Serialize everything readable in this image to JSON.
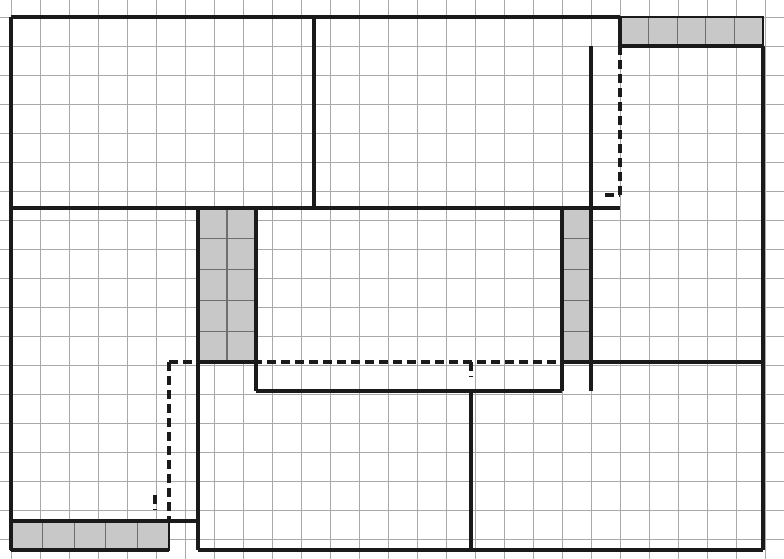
{
  "diagram": {
    "type": "architectural-grid-plan",
    "canvas": {
      "width": 784,
      "height": 559
    },
    "colors": {
      "background": "#ffffff",
      "grid_line": "#a9a9a9",
      "heavy_line": "#1a1a1a",
      "dashed_line": "#1a1a1a",
      "shaded_fill": "#c8c8c8",
      "shaded_stroke": "#6e6e6e"
    },
    "grid": {
      "origin_x": 11,
      "origin_y": 17,
      "cell_width": 29,
      "cell_height": 29,
      "columns": 26,
      "rows": 18,
      "line_width": 1,
      "visible": true,
      "extent_note": "Light gray square grid covering the full plan area; heavy lines snap to grid intersections."
    },
    "outline": {
      "label": "Overall plan boundary",
      "left": 11,
      "top": 17,
      "right": 763,
      "bottom": 550,
      "stroke_width": 4
    },
    "heavy_walls": [
      {
        "name": "outer-top-left-segment",
        "x1": 11,
        "y1": 17,
        "x2": 620,
        "y2": 17
      },
      {
        "name": "outer-top-right-segment",
        "x1": 620,
        "y1": 46,
        "x2": 763,
        "y2": 46
      },
      {
        "name": "shaded-top-strip-left-edge",
        "x1": 620,
        "y1": 17,
        "x2": 620,
        "y2": 46
      },
      {
        "name": "outer-left-edge",
        "x1": 11,
        "y1": 17,
        "x2": 11,
        "y2": 521
      },
      {
        "name": "outer-left-lower-edge",
        "x1": 11,
        "y1": 521,
        "x2": 11,
        "y2": 550
      },
      {
        "name": "outer-right-edge",
        "x1": 763,
        "y1": 46,
        "x2": 763,
        "y2": 550
      },
      {
        "name": "outer-bottom-edge",
        "x1": 198,
        "y1": 550,
        "x2": 763,
        "y2": 550
      },
      {
        "name": "bottom-left-strip-bottom",
        "x1": 11,
        "y1": 550,
        "x2": 169,
        "y2": 550
      },
      {
        "name": "bottom-left-strip-top",
        "x1": 11,
        "y1": 521,
        "x2": 198,
        "y2": 521
      },
      {
        "name": "upper-mid-vertical-divider",
        "x1": 314,
        "y1": 17,
        "x2": 314,
        "y2": 208
      },
      {
        "name": "mid-horizontal-wall-left",
        "x1": 11,
        "y1": 208,
        "x2": 591,
        "y2": 208
      },
      {
        "name": "mid-horizontal-wall-right-stub",
        "x1": 591,
        "y1": 208,
        "x2": 620,
        "y2": 208
      },
      {
        "name": "core-room-left-wall",
        "x1": 256,
        "y1": 208,
        "x2": 256,
        "y2": 391
      },
      {
        "name": "core-room-bottom-wall",
        "x1": 256,
        "y1": 391,
        "x2": 562,
        "y2": 391
      },
      {
        "name": "core-room-right-wall",
        "x1": 562,
        "y1": 362,
        "x2": 562,
        "y2": 391
      },
      {
        "name": "lower-right-horizontal-wall",
        "x1": 562,
        "y1": 362,
        "x2": 763,
        "y2": 362
      },
      {
        "name": "right-shaded-col-left-wall",
        "x1": 562,
        "y1": 208,
        "x2": 562,
        "y2": 362
      },
      {
        "name": "right-shaded-col-right-wall",
        "x1": 591,
        "y1": 208,
        "x2": 591,
        "y2": 362
      },
      {
        "name": "right-upper-room-left-wall",
        "x1": 591,
        "y1": 46,
        "x2": 591,
        "y2": 391
      },
      {
        "name": "left-shaded-col-left-wall",
        "x1": 198,
        "y1": 208,
        "x2": 198,
        "y2": 362
      },
      {
        "name": "left-shaded-col-bottom",
        "x1": 198,
        "y1": 362,
        "x2": 256,
        "y2": 362
      },
      {
        "name": "lower-left-room-right-wall",
        "x1": 198,
        "y1": 362,
        "x2": 198,
        "y2": 550
      },
      {
        "name": "lower-center-vertical-divider",
        "x1": 471,
        "y1": 391,
        "x2": 471,
        "y2": 550
      }
    ],
    "dashed_lines": [
      {
        "name": "upper-right-hidden-vertical",
        "x1": 620,
        "y1": 46,
        "x2": 620,
        "y2": 195
      },
      {
        "name": "upper-right-hidden-bottom-jog",
        "x1": 605,
        "y1": 195,
        "x2": 620,
        "y2": 195
      },
      {
        "name": "center-hidden-horizontal",
        "x1": 169,
        "y1": 362,
        "x2": 562,
        "y2": 362
      },
      {
        "name": "lower-left-hidden-vertical",
        "x1": 169,
        "y1": 362,
        "x2": 169,
        "y2": 521
      },
      {
        "name": "core-room-tick-vertical",
        "x1": 471,
        "y1": 362,
        "x2": 471,
        "y2": 377
      },
      {
        "name": "lower-left-tick-vertical",
        "x1": 155,
        "y1": 495,
        "x2": 155,
        "y2": 510
      }
    ],
    "shaded_blocks": [
      {
        "name": "top-right-shaded-strip",
        "x": 620,
        "y": 17,
        "width": 143,
        "height": 29,
        "cells_across": 5,
        "cells_down": 1,
        "label": "Upper right shaded band (5 cells)"
      },
      {
        "name": "left-center-shaded-column",
        "x": 198,
        "y": 208,
        "width": 58,
        "height": 154,
        "cells_across": 2,
        "cells_down": 5,
        "label": "Left center shaded column (2 x 5 cells)"
      },
      {
        "name": "right-center-shaded-column",
        "x": 562,
        "y": 208,
        "width": 29,
        "height": 154,
        "cells_across": 1,
        "cells_down": 5,
        "label": "Right center shaded column (1 x 5 cells)"
      },
      {
        "name": "bottom-left-shaded-strip",
        "x": 11,
        "y": 521,
        "width": 158,
        "height": 29,
        "cells_across": 5,
        "cells_down": 1,
        "label": "Lower left shaded band (5 cells)"
      }
    ],
    "legend": {
      "solid_meaning": "Heavy solid line = partition wall",
      "dashed_meaning": "Dashed line = hidden or proposed edge",
      "shaded_meaning": "Gray fill = highlighted module / filled cells",
      "grid_meaning": "Light gray square grid = dimensional module"
    }
  }
}
